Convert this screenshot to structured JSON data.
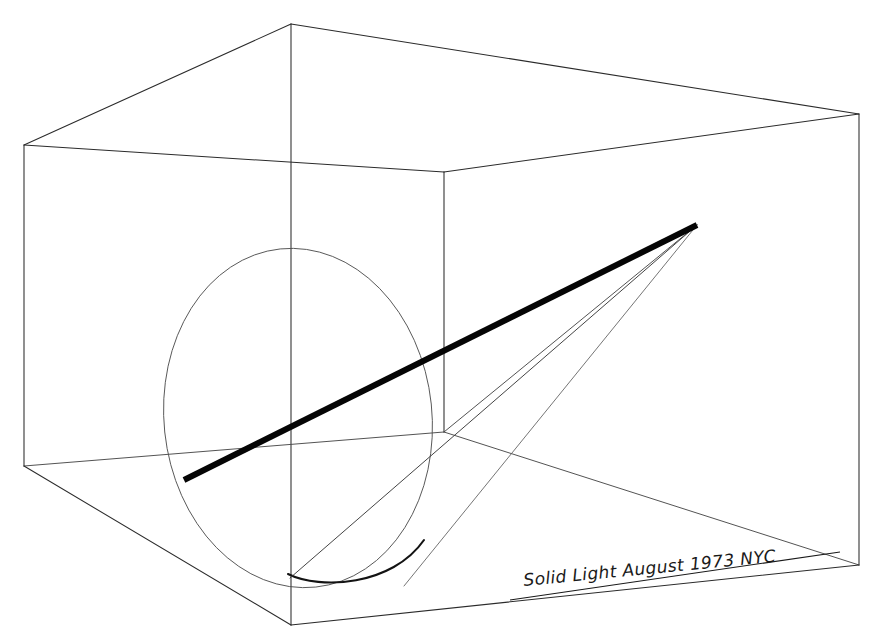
{
  "artwork": {
    "title": "Solid Light",
    "medium_note": "line drawing of a projected light cone inside a room",
    "canvas": {
      "width": 880,
      "height": 638,
      "background": "#ffffff"
    }
  },
  "signature": {
    "line_text": "Solid Light   August 1973  NYC",
    "title_part": "Solid Light",
    "date_part": "August 1973",
    "place_part": "NYC",
    "rotation_deg": -5.5,
    "x": 524,
    "y": 586,
    "ink_color": "#1a1a1a"
  },
  "palette": {
    "paper": "#ffffff",
    "ink_line": "#2b2b2b",
    "ink_faint": "#5c5c5c",
    "ink_beam": "#050505"
  },
  "geometry": {
    "room": {
      "ceiling_apex": [
        291,
        24
      ],
      "ceiling_left": [
        24,
        145
      ],
      "ceiling_right": [
        859,
        114
      ],
      "back_top": [
        444,
        172
      ],
      "floor_front": [
        291,
        625
      ],
      "floor_left": [
        24,
        466
      ],
      "floor_right": [
        859,
        565
      ],
      "back_bottom": [
        444,
        432
      ]
    },
    "projector_apex": [
      697,
      225
    ],
    "beam_end_floor": [
      184,
      480
    ],
    "beam_width_px": 6.0,
    "ellipse": {
      "cx": 298,
      "cy": 418,
      "rx": 134,
      "ry": 170,
      "rotation_deg": -6
    }
  },
  "paths": {
    "ceiling_left_edge": "M 291 24 L 24 145",
    "ceiling_right_edge": "M 291 24 L 859 114",
    "ceiling_back_left": "M 24 145 L 444 172",
    "ceiling_back_right": "M 444 172 L 859 114",
    "front_vertical": "M 291 24 L 291 625",
    "left_wall_vertical": "M 24 145 L 24 466",
    "right_wall_vertical": "M 859 114 L 859 565",
    "back_vertical": "M 444 172 L 444 432",
    "floor_back_left": "M 24 466 L 444 432",
    "floor_back_right": "M 444 432 L 859 565",
    "floor_front_left": "M 24 466 L 291 625",
    "floor_front_right": "M 291 625 L 859 565",
    "wall_line_to_apex": "M 444 432 L 697 225",
    "mid_wall_line": "M 444 432 L 24 466",
    "beam_solid": "M 184 480 L 697 225",
    "cone_edge_lower_left": "M 697 225 L 290 578",
    "cone_edge_lower_right": "M 697 225 L 404 586",
    "cone_edge_upper": "M 697 225 L 184 480",
    "ellipse_arc_floor": "M 288 574 C 320 590 392 586 424 540",
    "signature_rule": "M 510 600 L 840 552"
  }
}
